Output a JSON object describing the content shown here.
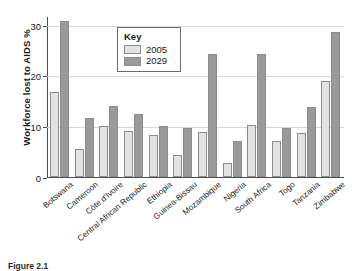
{
  "figure": {
    "caption": "Figure 2.1"
  },
  "legend": {
    "title": "Key",
    "entries": [
      {
        "label": "2005",
        "color": "#e2e2e2"
      },
      {
        "label": "2029",
        "color": "#9a9a9a"
      }
    ]
  },
  "axis": {
    "ylabel": "Workforce lost to AIDS %",
    "yticks": [
      "0",
      "10",
      "20",
      "30"
    ]
  },
  "chart_data": {
    "type": "bar",
    "title": "",
    "xlabel": "",
    "ylabel": "Workforce lost to AIDS %",
    "ylim": [
      0,
      31.5
    ],
    "yticks": [
      0,
      10,
      20,
      30
    ],
    "grid": true,
    "legend_position": "inside-top-center",
    "legend_title": "Key",
    "categories": [
      "Botswana",
      "Cameroon",
      "Côte d'Ivoire",
      "Central African Republic",
      "Ethiopia",
      "Guinea-Bissau",
      "Mozambique",
      "Nigeria",
      "South Africa",
      "Togo",
      "Tanzania",
      "Zimbabwe"
    ],
    "series": [
      {
        "name": "2005",
        "color": "#e2e2e2",
        "values": [
          16.8,
          5.5,
          10.1,
          9.1,
          8.2,
          4.3,
          8.9,
          2.8,
          10.3,
          7.0,
          8.6,
          19.0
        ]
      },
      {
        "name": "2029",
        "color": "#9a9a9a",
        "values": [
          30.8,
          11.7,
          14.0,
          12.4,
          10.0,
          9.6,
          24.3,
          7.1,
          24.3,
          9.7,
          13.8,
          28.5
        ]
      }
    ]
  }
}
